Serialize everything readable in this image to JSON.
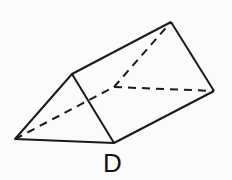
{
  "diagram": {
    "type": "triangular-prism",
    "label": "D",
    "stroke_color": "#1a1a1a",
    "vertices": {
      "front_left": [
        15,
        139
      ],
      "front_top": [
        72,
        74
      ],
      "front_bottom": [
        114,
        143
      ],
      "back_top": [
        171,
        22
      ],
      "back_right": [
        214,
        91
      ],
      "back_hidden": [
        114,
        87
      ]
    }
  }
}
